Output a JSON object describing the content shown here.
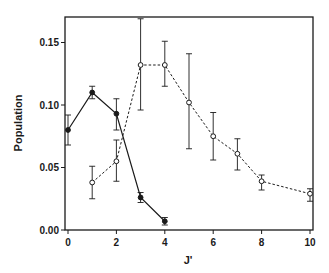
{
  "chart_data": {
    "type": "line",
    "title": "",
    "xlabel": "J'",
    "ylabel": "Population",
    "xlim": [
      0,
      10
    ],
    "ylim": [
      0.0,
      0.17
    ],
    "grid": false,
    "legend": null,
    "x_ticks": [
      0,
      2,
      4,
      6,
      8,
      10
    ],
    "x_tick_labels": [
      "0",
      "2",
      "4",
      "6",
      "8",
      "10"
    ],
    "y_ticks": [
      0.0,
      0.05,
      0.1,
      0.15
    ],
    "y_tick_labels": [
      "0.00",
      "0.05",
      "0.10",
      "0.15"
    ],
    "series": [
      {
        "name": "filled",
        "marker": "filled-circle",
        "line": "solid",
        "x": [
          0,
          1,
          2,
          3,
          4
        ],
        "values": [
          0.08,
          0.11,
          0.093,
          0.026,
          0.007
        ],
        "err_low": [
          0.068,
          0.105,
          0.08,
          0.022,
          0.004
        ],
        "err_high": [
          0.092,
          0.115,
          0.105,
          0.03,
          0.01
        ]
      },
      {
        "name": "open",
        "marker": "open-circle",
        "line": "dashed",
        "x": [
          1,
          2,
          3,
          4,
          5,
          6,
          7,
          8,
          10
        ],
        "values": [
          0.038,
          0.055,
          0.132,
          0.132,
          0.102,
          0.075,
          0.061,
          0.039,
          0.029
        ],
        "err_low": [
          0.025,
          0.039,
          0.096,
          0.115,
          0.065,
          0.056,
          0.048,
          0.032,
          0.023
        ],
        "err_high": [
          0.051,
          0.072,
          0.169,
          0.151,
          0.141,
          0.094,
          0.073,
          0.044,
          0.033
        ]
      }
    ]
  },
  "colors": {
    "ink": "#1a1a1a",
    "background": "#ffffff"
  }
}
